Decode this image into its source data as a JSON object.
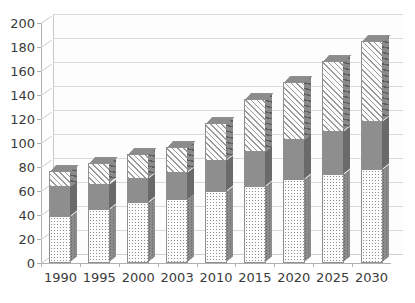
{
  "chart_data": {
    "type": "bar",
    "subtype": "stacked-column-3d",
    "title": "",
    "subtitle": "",
    "xlabel": "",
    "ylabel": "",
    "ylim": [
      0,
      200
    ],
    "ytick_step": 20,
    "yticks": [
      0,
      20,
      40,
      60,
      80,
      100,
      120,
      140,
      160,
      180,
      200
    ],
    "grid": true,
    "legend": false,
    "legend_position": "none",
    "categories": [
      "1990",
      "1995",
      "2000",
      "2003",
      "2010",
      "2015",
      "2020",
      "2025",
      "2030"
    ],
    "series": [
      {
        "name": "series-1",
        "pattern": "dotted",
        "color": "#fcfcfc",
        "values": [
          39,
          45,
          51,
          53,
          60,
          64,
          70,
          74,
          78
        ]
      },
      {
        "name": "series-2",
        "pattern": "solid-gray",
        "color": "#8e8e8e",
        "values": [
          25,
          21,
          20,
          23,
          26,
          29,
          33,
          36,
          40
        ]
      },
      {
        "name": "series-3",
        "pattern": "diagonal-hatch",
        "color": "#fbfbfb",
        "values": [
          13,
          17,
          20,
          21,
          31,
          44,
          48,
          58,
          67
        ]
      }
    ],
    "totals": [
      77,
      83,
      91,
      97,
      117,
      137,
      151,
      168,
      185
    ]
  }
}
